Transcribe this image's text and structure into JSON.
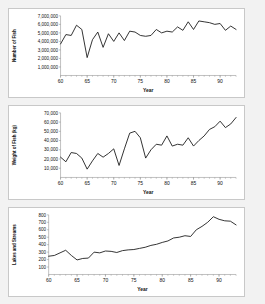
{
  "page": {
    "background": "#f2f2f2",
    "panel_background": "#ffffff",
    "panel_border": "#c8c8c8",
    "line_color": "#1a1a1a",
    "axis_color": "#808080"
  },
  "charts": [
    {
      "id": "number-of-fish",
      "type": "line",
      "title": "",
      "xlabel": "Year",
      "ylabel": "Number of Fish",
      "xlim": [
        60,
        93
      ],
      "ylim": [
        0,
        7000000
      ],
      "xticks": [
        60,
        65,
        70,
        75,
        80,
        85,
        90
      ],
      "xtick_labels": [
        "60",
        "65",
        "70",
        "75",
        "80",
        "85",
        "90"
      ],
      "yticks": [
        1000000,
        2000000,
        3000000,
        4000000,
        5000000,
        6000000,
        7000000
      ],
      "ytick_labels": [
        "1,000,000",
        "2,000,000",
        "3,000,000",
        "4,000,000",
        "5,000,000",
        "6,000,000",
        "7,000,000"
      ],
      "grid": false,
      "legend": null,
      "x": [
        60,
        61,
        62,
        63,
        64,
        65,
        66,
        67,
        68,
        69,
        70,
        71,
        72,
        73,
        74,
        75,
        76,
        77,
        78,
        79,
        80,
        81,
        82,
        83,
        84,
        85,
        86,
        87,
        88,
        89,
        90,
        91,
        92,
        93
      ],
      "values": [
        3700000,
        4800000,
        4700000,
        5900000,
        5400000,
        2100000,
        4200000,
        5100000,
        3300000,
        4900000,
        4000000,
        5000000,
        4100000,
        5200000,
        5100000,
        4700000,
        4600000,
        4700000,
        5400000,
        5000000,
        5200000,
        5100000,
        5700000,
        5300000,
        6300000,
        5400000,
        6400000,
        6300000,
        6200000,
        6000000,
        6100000,
        5300000,
        5800000,
        5400000
      ]
    },
    {
      "id": "weight-of-fish",
      "type": "line",
      "title": "",
      "xlabel": "Year",
      "ylabel": "Weight of Fish (kg)",
      "xlim": [
        60,
        93
      ],
      "ylim": [
        0,
        70000
      ],
      "xticks": [
        60,
        65,
        70,
        75,
        80,
        85,
        90
      ],
      "xtick_labels": [
        "60",
        "65",
        "70",
        "75",
        "80",
        "85",
        "90"
      ],
      "yticks": [
        10000,
        20000,
        30000,
        40000,
        50000,
        60000,
        70000
      ],
      "ytick_labels": [
        "10,000",
        "20,000",
        "30,000",
        "40,000",
        "50,000",
        "60,000",
        "70,000"
      ],
      "grid": false,
      "legend": null,
      "x": [
        60,
        61,
        62,
        63,
        64,
        65,
        66,
        67,
        68,
        69,
        70,
        71,
        72,
        73,
        74,
        75,
        76,
        77,
        78,
        79,
        80,
        81,
        82,
        83,
        84,
        85,
        86,
        87,
        88,
        89,
        90,
        91,
        92,
        93
      ],
      "values": [
        22000,
        17000,
        27000,
        26000,
        21000,
        9000,
        18000,
        26000,
        22000,
        26000,
        31000,
        13000,
        31000,
        48000,
        50000,
        43000,
        21000,
        30000,
        36000,
        35000,
        45000,
        34000,
        36000,
        35000,
        43000,
        34000,
        40000,
        45000,
        52000,
        55000,
        61000,
        54000,
        58000,
        65000
      ]
    },
    {
      "id": "lakes-and-streams",
      "type": "line",
      "title": "",
      "xlabel": "Year",
      "ylabel": "Lakes and Streams",
      "xlim": [
        60,
        93
      ],
      "ylim": [
        0,
        800
      ],
      "xticks": [
        60,
        65,
        70,
        75,
        80,
        85,
        90
      ],
      "xtick_labels": [
        "60",
        "65",
        "70",
        "75",
        "80",
        "85",
        "90"
      ],
      "yticks": [
        100,
        200,
        300,
        400,
        500,
        600,
        700,
        800
      ],
      "ytick_labels": [
        "100",
        "200",
        "300",
        "400",
        "500",
        "600",
        "700",
        "800"
      ],
      "grid": false,
      "legend": null,
      "x": [
        60,
        61,
        62,
        63,
        64,
        65,
        66,
        67,
        68,
        69,
        70,
        71,
        72,
        73,
        74,
        75,
        76,
        77,
        78,
        79,
        80,
        81,
        82,
        83,
        84,
        85,
        86,
        87,
        88,
        89,
        90,
        91,
        92,
        93
      ],
      "values": [
        245,
        255,
        290,
        325,
        255,
        195,
        215,
        220,
        300,
        290,
        315,
        310,
        295,
        320,
        330,
        335,
        350,
        365,
        390,
        405,
        430,
        450,
        490,
        500,
        520,
        510,
        600,
        645,
        700,
        775,
        740,
        720,
        715,
        665
      ]
    }
  ]
}
